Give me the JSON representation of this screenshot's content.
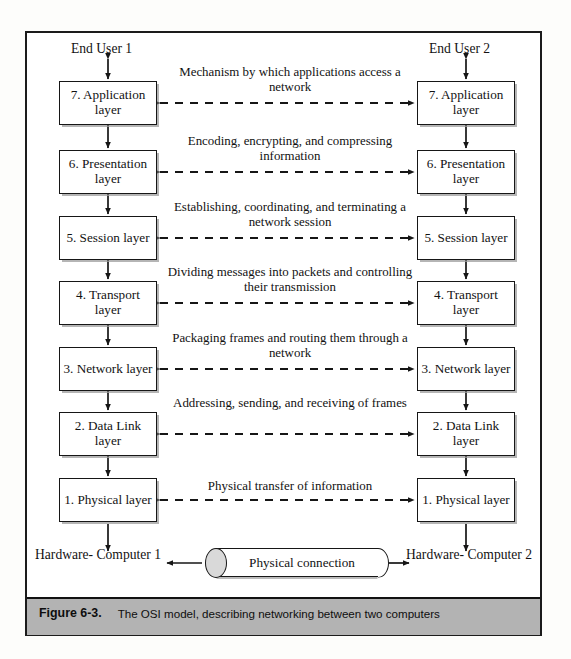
{
  "figure": {
    "caption_label": "Figure 6-3.",
    "caption_text": "The OSI model, describing networking between two computers"
  },
  "endpoints": {
    "end_user_left": "End User 1",
    "end_user_right": "End User 2",
    "hardware_left": "Hardware- Computer 1",
    "hardware_right": "Hardware- Computer 2",
    "physical_connection": "Physical connection"
  },
  "layers": [
    {
      "number": 7,
      "left_label": "7. Application layer",
      "right_label": "7. Application layer",
      "description": "Mechanism by which applications access a network"
    },
    {
      "number": 6,
      "left_label": "6. Presentation layer",
      "right_label": "6. Presentation layer",
      "description": "Encoding, encrypting, and compressing information"
    },
    {
      "number": 5,
      "left_label": "5. Session layer",
      "right_label": "5. Session layer",
      "description": "Establishing, coordinating, and terminating a network session"
    },
    {
      "number": 4,
      "left_label": "4. Transport layer",
      "right_label": "4. Transport layer",
      "description": "Dividing messages into packets and controlling their transmission"
    },
    {
      "number": 3,
      "left_label": "3. Network layer",
      "right_label": "3. Network layer",
      "description": "Packaging frames and routing them through a network"
    },
    {
      "number": 2,
      "left_label": "2. Data Link layer",
      "right_label": "2. Data Link layer",
      "description": "Addressing, sending, and receiving of frames"
    },
    {
      "number": 1,
      "left_label": "1. Physical layer",
      "right_label": "1. Physical layer",
      "description": "Physical transfer of information"
    }
  ],
  "colors": {
    "ink": "#121212",
    "border": "#161616",
    "caption_bar": "#b3b3b3",
    "paper": "#ffffff"
  }
}
